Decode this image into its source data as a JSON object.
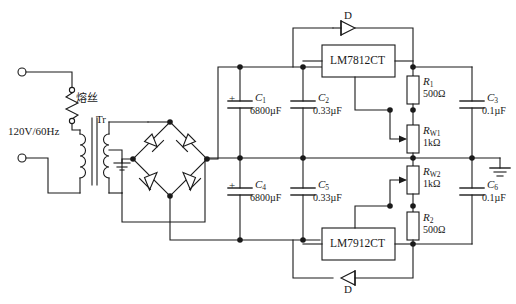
{
  "diagram": {
    "type": "electronic-schematic",
    "background": "#ffffff",
    "line_color": "#1a1a1a"
  },
  "source": {
    "voltage_label": "120V/60Hz",
    "fuse_label": "熔丝",
    "transformer_label": "Tr"
  },
  "regulators": [
    {
      "id": "u1",
      "label": "LM7812CT"
    },
    {
      "id": "u2",
      "label": "LM7912CT"
    }
  ],
  "diodes": [
    {
      "id": "d_top",
      "label": "D"
    },
    {
      "id": "d_bottom",
      "label": "D"
    }
  ],
  "capacitors": [
    {
      "id": "c1",
      "name": "C",
      "index": "1",
      "value": "6800µF",
      "polarity": "+"
    },
    {
      "id": "c2",
      "name": "C",
      "index": "2",
      "value": "0.33µF",
      "polarity": ""
    },
    {
      "id": "c3",
      "name": "C",
      "index": "3",
      "value": "0.1µF",
      "polarity": ""
    },
    {
      "id": "c4",
      "name": "C",
      "index": "4",
      "value": "6800µF",
      "polarity": "+"
    },
    {
      "id": "c5",
      "name": "C",
      "index": "5",
      "value": "0.33µF",
      "polarity": ""
    },
    {
      "id": "c6",
      "name": "C",
      "index": "6",
      "value": "0.1µF",
      "polarity": ""
    }
  ],
  "resistors": [
    {
      "id": "r1",
      "name": "R",
      "index": "1",
      "value": "500Ω"
    },
    {
      "id": "rw1",
      "name": "R",
      "index": "W1",
      "value": "1kΩ"
    },
    {
      "id": "rw2",
      "name": "R",
      "index": "W2",
      "value": "1kΩ"
    },
    {
      "id": "r2",
      "name": "R",
      "index": "2",
      "value": "500Ω"
    }
  ],
  "terminals": [
    {
      "id": "ac_top",
      "shape": "circle"
    },
    {
      "id": "ac_bottom",
      "shape": "circle"
    }
  ],
  "grounds": [
    {
      "id": "transformer_center_tap_ground"
    },
    {
      "id": "output_common_ground"
    }
  ]
}
